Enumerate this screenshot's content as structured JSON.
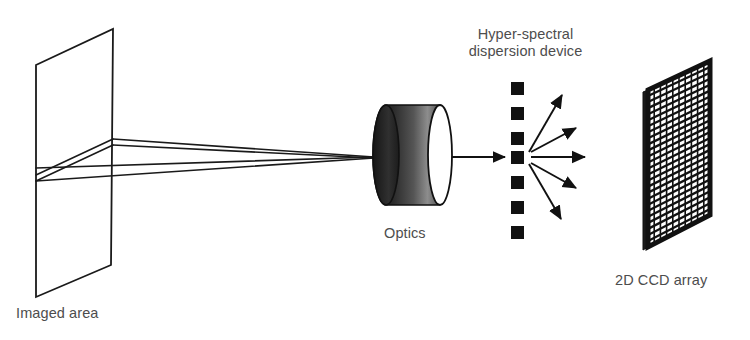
{
  "figure": {
    "background_color": "#ffffff",
    "ink_color": "#1a1a1a",
    "label_color": "#4d4d4d",
    "width": 750,
    "height": 340
  },
  "labels": {
    "imaged_area": "Imaged area",
    "optics": "Optics",
    "dispersion_line1": "Hyper-spectral",
    "dispersion_line2": "dispersion device",
    "ccd_array": "2D CCD array"
  },
  "components": {
    "imaged_area": {
      "name": "Imaged area",
      "shape": "parallelogram-plane",
      "stroke": "#1a1a1a",
      "fill": "#ffffff",
      "points": "36,65 113,29 111,265 36,297"
    },
    "rays": {
      "name": "light rays converging to optics",
      "stroke": "#1a1a1a",
      "count": 4,
      "converge_point": "374,157",
      "sources": [
        "36,175",
        "113,141",
        "36,182",
        "36,168"
      ]
    },
    "optics": {
      "name": "Optics",
      "shape": "cylinder-lens",
      "body_left": 374,
      "body_right": 450,
      "top": 105,
      "bottom": 205,
      "body_gradient": [
        "#3b3b3b",
        "#1c1c1c",
        "#4a4a4a",
        "#8f8f8f",
        "#5a5a5a",
        "#2a2a2a"
      ],
      "face_fill": "#ffffff",
      "face_stroke": "#111111"
    },
    "optics_to_device_arrow": {
      "name": "beam arrow from optics to dispersion device",
      "from": "450,157",
      "to": "506,157",
      "stroke": "#111111"
    },
    "dispersion_device": {
      "name": "Hyper-spectral dispersion device",
      "shape": "column-of-squares",
      "square_count": 7,
      "square_size": 13,
      "x": 511,
      "first_y": 82,
      "spacing": 25,
      "fill": "#111111"
    },
    "dispersed_arrows": {
      "name": "dispersed spectral beams",
      "count": 5,
      "origin": "527,157",
      "stroke": "#111111",
      "endpoints": [
        "563,93",
        "575,130",
        "585,157",
        "575,185",
        "561,218"
      ]
    },
    "ccd_array": {
      "name": "2D CCD array",
      "shape": "grid-parallelogram",
      "points": "645,88 713,57 713,218 645,250",
      "frame_stroke": "#111111",
      "cell_fill": "#ffffff",
      "grid_line": "#111111",
      "columns": 10,
      "rows": 26,
      "side_edge_fill": "#1a1a1a"
    }
  }
}
